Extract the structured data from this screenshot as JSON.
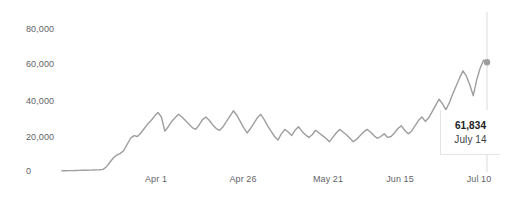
{
  "chart_data": {
    "type": "line",
    "title": "",
    "subtitle": "",
    "xlabel": "",
    "ylabel": "",
    "ylim": [
      0,
      88000
    ],
    "yticks": [
      0,
      20000,
      40000,
      60000,
      80000
    ],
    "ytick_labels": [
      "0",
      "20,000",
      "40,000",
      "60,000",
      "80,000"
    ],
    "xtick_labels": [
      "Apr 1",
      "Apr 26",
      "May 21",
      "Jun 15",
      "Jul 10"
    ],
    "xtick_positions_px": [
      156,
      243,
      328,
      400,
      479
    ],
    "grid": false,
    "legend": null,
    "series_color": "#9e9e9e",
    "x": [
      "Mar 12",
      "Mar 13",
      "Mar 14",
      "Mar 15",
      "Mar 16",
      "Mar 17",
      "Mar 18",
      "Mar 19",
      "Mar 20",
      "Mar 21",
      "Mar 22",
      "Mar 23",
      "Mar 24",
      "Mar 25",
      "Mar 26",
      "Mar 27",
      "Mar 28",
      "Mar 29",
      "Mar 30",
      "Mar 31",
      "Apr 1",
      "Apr 2",
      "Apr 3",
      "Apr 4",
      "Apr 5",
      "Apr 6",
      "Apr 7",
      "Apr 8",
      "Apr 9",
      "Apr 10",
      "Apr 11",
      "Apr 12",
      "Apr 13",
      "Apr 14",
      "Apr 15",
      "Apr 16",
      "Apr 17",
      "Apr 18",
      "Apr 19",
      "Apr 20",
      "Apr 21",
      "Apr 22",
      "Apr 23",
      "Apr 24",
      "Apr 25",
      "Apr 26",
      "Apr 27",
      "Apr 28",
      "Apr 29",
      "Apr 30",
      "May 1",
      "May 2",
      "May 3",
      "May 4",
      "May 5",
      "May 6",
      "May 7",
      "May 8",
      "May 9",
      "May 10",
      "May 11",
      "May 12",
      "May 13",
      "May 14",
      "May 15",
      "May 16",
      "May 17",
      "May 18",
      "May 19",
      "May 20",
      "May 21",
      "May 22",
      "May 23",
      "May 24",
      "May 25",
      "May 26",
      "May 27",
      "May 28",
      "May 29",
      "May 30",
      "May 31",
      "Jun 1",
      "Jun 2",
      "Jun 3",
      "Jun 4",
      "Jun 5",
      "Jun 6",
      "Jun 7",
      "Jun 8",
      "Jun 9",
      "Jun 10",
      "Jun 11",
      "Jun 12",
      "Jun 13",
      "Jun 14",
      "Jun 15",
      "Jun 16",
      "Jun 17",
      "Jun 18",
      "Jun 19",
      "Jun 20",
      "Jun 21",
      "Jun 22",
      "Jun 23",
      "Jun 24",
      "Jun 25",
      "Jun 26",
      "Jun 27",
      "Jun 28",
      "Jun 29",
      "Jun 30",
      "Jul 1",
      "Jul 2",
      "Jul 3",
      "Jul 4",
      "Jul 5",
      "Jul 6",
      "Jul 7",
      "Jul 8",
      "Jul 9",
      "Jul 10",
      "Jul 11",
      "Jul 12",
      "Jul 13",
      "Jul 14"
    ],
    "values": [
      700,
      720,
      760,
      800,
      850,
      900,
      950,
      1000,
      1050,
      1100,
      1200,
      1300,
      1500,
      3000,
      5500,
      8000,
      9500,
      10500,
      12000,
      15500,
      19000,
      20500,
      20000,
      22000,
      24500,
      27000,
      29000,
      31500,
      33500,
      31000,
      23000,
      25500,
      28500,
      30500,
      32500,
      31000,
      29000,
      27000,
      25000,
      24000,
      26500,
      29500,
      31000,
      29000,
      26500,
      24500,
      23500,
      25500,
      28500,
      31500,
      34500,
      32000,
      28500,
      25000,
      22000,
      24500,
      27500,
      30500,
      32500,
      29500,
      26000,
      23000,
      20000,
      18000,
      21500,
      24000,
      22500,
      20500,
      23500,
      25500,
      23000,
      21000,
      19500,
      21000,
      23500,
      22000,
      20500,
      19000,
      17000,
      19500,
      22000,
      24000,
      22500,
      21000,
      19000,
      17000,
      18500,
      20500,
      22500,
      24000,
      22500,
      20500,
      19000,
      20000,
      21500,
      19500,
      20000,
      22000,
      24500,
      26000,
      23500,
      21500,
      23000,
      26000,
      29000,
      31000,
      28500,
      30500,
      34000,
      37500,
      41000,
      38500,
      35000,
      39000,
      44000,
      48500,
      53000,
      57000,
      54000,
      49000,
      43000,
      52000,
      58500,
      63000,
      61834
    ],
    "highlight": {
      "value_label": "61,834",
      "date_label": "July 14",
      "x_px": 487,
      "y_px": 68
    }
  }
}
